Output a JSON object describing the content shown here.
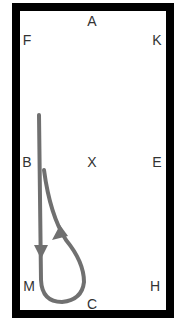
{
  "diagram": {
    "letters": {
      "A": "A",
      "F": "F",
      "K": "K",
      "B": "B",
      "X": "X",
      "E": "E",
      "M": "M",
      "H": "H",
      "C": "C"
    },
    "path_color": "#707070",
    "border_color": "#000000"
  }
}
